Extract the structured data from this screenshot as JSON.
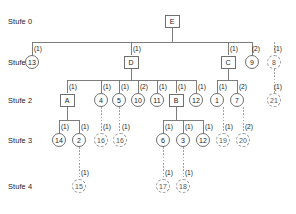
{
  "diagram": {
    "type": "hierarchical-tree",
    "title": "",
    "levels": [
      {
        "id": "stufe0",
        "label": "Stufe 0",
        "y": 21
      },
      {
        "id": "stufe1",
        "label": "Stufe 1",
        "y": 62
      },
      {
        "id": "stufe2",
        "label": "Stufe 2",
        "y": 100
      },
      {
        "id": "stufe3",
        "label": "Stufe 3",
        "y": 140
      },
      {
        "id": "stufe4",
        "label": "Stufe 4",
        "y": 186
      }
    ],
    "nodes": [
      {
        "id": "E",
        "label": "E",
        "shape": "square",
        "level": 0,
        "x": 172,
        "y": 21
      },
      {
        "id": "n13",
        "label": "13",
        "shape": "circle",
        "level": 1,
        "x": 32,
        "y": 62,
        "edge": "(1)"
      },
      {
        "id": "D",
        "label": "D",
        "shape": "square",
        "level": 1,
        "x": 131,
        "y": 62,
        "edge": "(1)"
      },
      {
        "id": "C",
        "label": "C",
        "shape": "square",
        "level": 1,
        "x": 228,
        "y": 62,
        "edge": "(1)"
      },
      {
        "id": "n9",
        "label": "9",
        "shape": "circle",
        "level": 1,
        "x": 252,
        "y": 62,
        "edge": "(2)"
      },
      {
        "id": "n8",
        "label": "8",
        "shape": "circle-dashed",
        "level": 1,
        "x": 274,
        "y": 62,
        "edge": "(1)"
      },
      {
        "id": "A",
        "label": "A",
        "shape": "square",
        "level": 2,
        "x": 67,
        "y": 100,
        "edge": "(1)"
      },
      {
        "id": "n4",
        "label": "4",
        "shape": "circle",
        "level": 2,
        "x": 101,
        "y": 100,
        "edge": "(1)"
      },
      {
        "id": "n5",
        "label": "5",
        "shape": "circle",
        "level": 2,
        "x": 119,
        "y": 100,
        "edge": "(1)"
      },
      {
        "id": "n10",
        "label": "10",
        "shape": "circle",
        "level": 2,
        "x": 138,
        "y": 100,
        "edge": "(2)"
      },
      {
        "id": "n11",
        "label": "11",
        "shape": "circle",
        "level": 2,
        "x": 157,
        "y": 100,
        "edge": "(1)"
      },
      {
        "id": "B",
        "label": "B",
        "shape": "square",
        "level": 2,
        "x": 176,
        "y": 100,
        "edge": "(1)"
      },
      {
        "id": "n12",
        "label": "12",
        "shape": "circle",
        "level": 2,
        "x": 196,
        "y": 100,
        "edge": "(1)"
      },
      {
        "id": "n1",
        "label": "1",
        "shape": "circle",
        "level": 2,
        "x": 217,
        "y": 100,
        "edge": "(1)"
      },
      {
        "id": "n7",
        "label": "7",
        "shape": "circle",
        "level": 2,
        "x": 237,
        "y": 100,
        "edge": "(2)"
      },
      {
        "id": "n21",
        "label": "21",
        "shape": "circle-dashed",
        "level": 2,
        "x": 274,
        "y": 100,
        "edge": "(1)"
      },
      {
        "id": "n14",
        "label": "14",
        "shape": "circle",
        "level": 3,
        "x": 59,
        "y": 140,
        "edge": "(1)"
      },
      {
        "id": "n2",
        "label": "2",
        "shape": "circle",
        "level": 3,
        "x": 79,
        "y": 140,
        "edge": "(1)"
      },
      {
        "id": "n16a",
        "label": "16",
        "shape": "circle-dashed",
        "level": 3,
        "x": 101,
        "y": 140,
        "edge": "(1)"
      },
      {
        "id": "n16b",
        "label": "16",
        "shape": "circle-dashed",
        "level": 3,
        "x": 120,
        "y": 140,
        "edge": "(1)"
      },
      {
        "id": "n6",
        "label": "6",
        "shape": "circle",
        "level": 3,
        "x": 163,
        "y": 140,
        "edge": "(1)"
      },
      {
        "id": "n3",
        "label": "3",
        "shape": "circle",
        "level": 3,
        "x": 183,
        "y": 140,
        "edge": "(1)"
      },
      {
        "id": "n12b",
        "label": "12",
        "shape": "circle",
        "level": 3,
        "x": 203,
        "y": 140,
        "edge": "(1)"
      },
      {
        "id": "n19",
        "label": "19",
        "shape": "circle-dashed",
        "level": 3,
        "x": 223,
        "y": 140,
        "edge": "(1)"
      },
      {
        "id": "n20",
        "label": "20",
        "shape": "circle-dashed",
        "level": 3,
        "x": 243,
        "y": 140,
        "edge": "(2)"
      },
      {
        "id": "n15",
        "label": "15",
        "shape": "circle-dashed",
        "level": 4,
        "x": 79,
        "y": 186,
        "edge": "(1)"
      },
      {
        "id": "n17",
        "label": "17",
        "shape": "circle-dashed",
        "level": 4,
        "x": 163,
        "y": 186,
        "edge": "(1)"
      },
      {
        "id": "n18",
        "label": "18",
        "shape": "circle-dashed",
        "level": 4,
        "x": 183,
        "y": 186,
        "edge": "(1)"
      }
    ],
    "edge_labels": [
      "(1)",
      "(1)",
      "(1)",
      "(2)",
      "(1)",
      "(1)",
      "(1)",
      "(1)",
      "(2)",
      "(1)",
      "(1)",
      "(1)",
      "(1)",
      "(2)",
      "(1)",
      "(1)",
      "(1)",
      "(1)",
      "(1)",
      "(1)",
      "(1)",
      "(1)",
      "(1)",
      "(2)",
      "(1)",
      "(1)",
      "(1)"
    ],
    "colors": {
      "stroke": "#6f6f6f",
      "dashed_stroke": "#9a9a9a",
      "text": "#1a1a1a",
      "background": "#ffffff"
    }
  }
}
